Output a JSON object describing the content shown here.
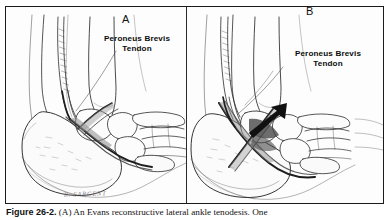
{
  "figure": {
    "caption_label": "Figure 26-2.",
    "caption_text": " (A) An Evans reconstructive lateral ankle tenodesis. One",
    "signature": "R. SARGENT"
  },
  "panels": [
    {
      "letter": "A",
      "label": "Peroneus Brevis\nTendon",
      "description": "Lateral view of foot and ankle skeleton with peroneus brevis tendon routed through fibula for Evans tenodesis"
    },
    {
      "letter": "B",
      "label": "Peroneus Brevis\nTendon",
      "description": "Lateral view of foot and ankle skeleton with crossed tendon graft and directional arrow indicating tensioning"
    }
  ],
  "colors": {
    "frame": "#1b1b1b",
    "ink": "#2b2b2b",
    "bone_fill": "#fbfbfb",
    "shadow": "#9a9a9a",
    "arrow": "#101010",
    "background": "#ffffff"
  }
}
